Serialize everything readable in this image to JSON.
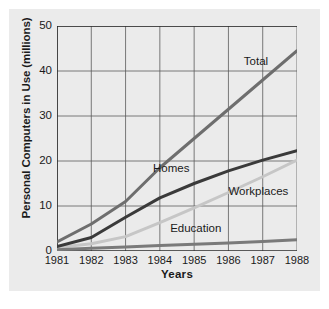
{
  "chart_data": {
    "type": "line",
    "title": "",
    "xlabel": "Years",
    "ylabel": "Personal Computers in Use (millions)",
    "categories": [
      "1981",
      "1982",
      "1983",
      "1984",
      "1985",
      "1986",
      "1987",
      "1988"
    ],
    "x": [
      1981,
      1982,
      1983,
      1984,
      1985,
      1986,
      1987,
      1988
    ],
    "xlim": [
      1981,
      1988
    ],
    "ylim": [
      0,
      50
    ],
    "yticks": [
      0,
      10,
      20,
      30,
      40,
      50
    ],
    "grid": true,
    "legend_position": "inline-labels",
    "series": [
      {
        "name": "Total",
        "color": "#6e6e6e",
        "values": [
          2.0,
          6.0,
          11.0,
          18.5,
          25.0,
          31.5,
          38.0,
          44.5
        ],
        "label_x": 1986.45,
        "label_y": 42.0
      },
      {
        "name": "Homes",
        "color": "#3a3a3a",
        "values": [
          1.0,
          3.0,
          7.5,
          11.8,
          15.0,
          17.8,
          20.2,
          22.3
        ],
        "label_x": 1983.8,
        "label_y": 18.2
      },
      {
        "name": "Workplaces",
        "color": "#c6c6c6",
        "values": [
          0.8,
          1.6,
          3.2,
          6.3,
          9.6,
          13.0,
          16.5,
          20.2
        ],
        "label_x": 1986.0,
        "label_y": 13.2
      },
      {
        "name": "Education",
        "color": "#7a7a7a",
        "values": [
          0.3,
          0.6,
          0.9,
          1.2,
          1.5,
          1.8,
          2.1,
          2.5
        ],
        "label_x": 1984.3,
        "label_y": 5.0
      }
    ]
  }
}
